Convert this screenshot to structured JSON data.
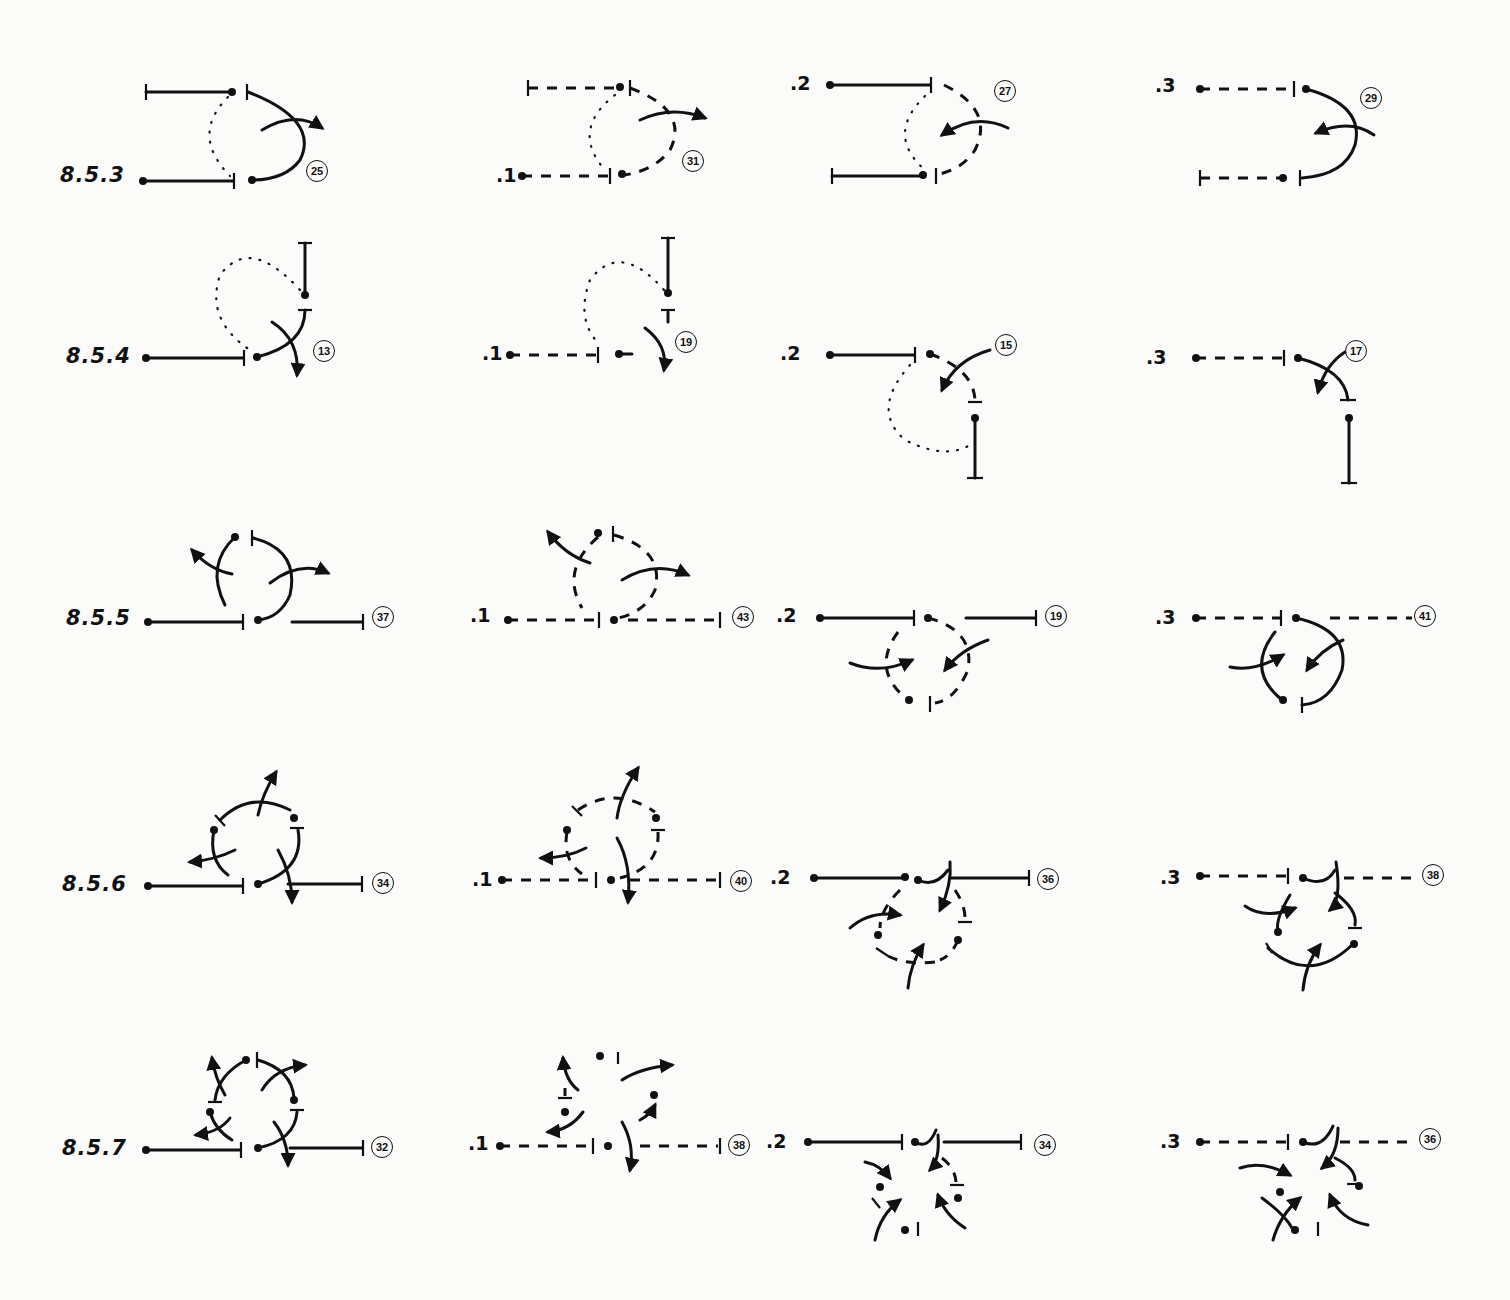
{
  "figure": {
    "line_color": "#111111",
    "background": "#fbfbfa"
  },
  "rows": [
    {
      "label": "8.5.3",
      "cells": [
        {
          "variant": "",
          "number": "25",
          "style": "solid"
        },
        {
          "variant": ".1",
          "number": "31",
          "style": "dashed"
        },
        {
          "variant": ".2",
          "number": "27",
          "style": "mixed"
        },
        {
          "variant": ".3",
          "number": "29",
          "style": "mixed"
        }
      ]
    },
    {
      "label": "8.5.4",
      "cells": [
        {
          "variant": "",
          "number": "13",
          "style": "solid"
        },
        {
          "variant": ".1",
          "number": "19",
          "style": "dashed"
        },
        {
          "variant": ".2",
          "number": "15",
          "style": "mixed"
        },
        {
          "variant": ".3",
          "number": "17",
          "style": "mixed"
        }
      ]
    },
    {
      "label": "8.5.5",
      "cells": [
        {
          "variant": "",
          "number": "37",
          "style": "solid"
        },
        {
          "variant": ".1",
          "number": "43",
          "style": "dashed"
        },
        {
          "variant": ".2",
          "number": "19",
          "style": "mixed"
        },
        {
          "variant": ".3",
          "number": "41",
          "style": "mixed"
        }
      ]
    },
    {
      "label": "8.5.6",
      "cells": [
        {
          "variant": "",
          "number": "34",
          "style": "solid"
        },
        {
          "variant": ".1",
          "number": "40",
          "style": "dashed"
        },
        {
          "variant": ".2",
          "number": "36",
          "style": "mixed"
        },
        {
          "variant": ".3",
          "number": "38",
          "style": "mixed"
        }
      ]
    },
    {
      "label": "8.5.7",
      "cells": [
        {
          "variant": "",
          "number": "32",
          "style": "solid"
        },
        {
          "variant": ".1",
          "number": "38",
          "style": "dashed"
        },
        {
          "variant": ".2",
          "number": "34",
          "style": "mixed"
        },
        {
          "variant": ".3",
          "number": "36",
          "style": "mixed"
        }
      ]
    }
  ]
}
